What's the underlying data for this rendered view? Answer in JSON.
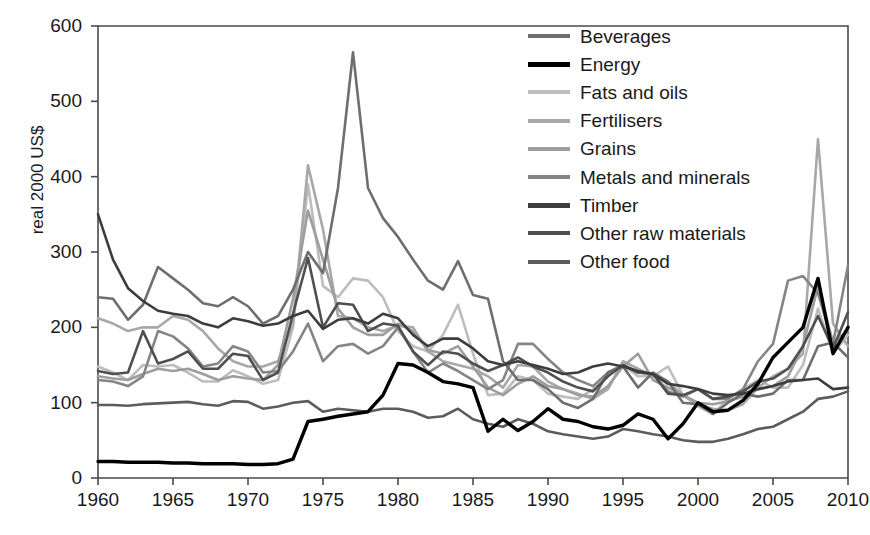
{
  "chart_data": {
    "type": "line",
    "title": "",
    "xlabel": "",
    "ylabel": "real 2000 US$",
    "xlim": [
      1960,
      2010
    ],
    "ylim": [
      0,
      600
    ],
    "grid": false,
    "legend_position": "inside-top-right",
    "x_ticks": [
      "1960",
      "1965",
      "1970",
      "1975",
      "1980",
      "1985",
      "1990",
      "1995",
      "2000",
      "2005",
      "2010"
    ],
    "y_ticks": [
      "0",
      "100",
      "200",
      "300",
      "400",
      "500",
      "600"
    ],
    "x": [
      1960,
      1961,
      1962,
      1963,
      1964,
      1965,
      1966,
      1967,
      1968,
      1969,
      1970,
      1971,
      1972,
      1973,
      1974,
      1975,
      1976,
      1977,
      1978,
      1979,
      1980,
      1981,
      1982,
      1983,
      1984,
      1985,
      1986,
      1987,
      1988,
      1989,
      1990,
      1991,
      1992,
      1993,
      1994,
      1995,
      1996,
      1997,
      1998,
      1999,
      2000,
      2001,
      2002,
      2003,
      2004,
      2005,
      2006,
      2007,
      2008,
      2009,
      2010
    ],
    "series": [
      {
        "name": "Beverages",
        "color": "#6e6e6e",
        "values": [
          240,
          238,
          210,
          230,
          280,
          265,
          250,
          232,
          228,
          240,
          228,
          205,
          215,
          250,
          300,
          272,
          385,
          565,
          385,
          345,
          320,
          290,
          262,
          250,
          288,
          243,
          238,
          155,
          130,
          130,
          118,
          100,
          93,
          105,
          140,
          148,
          120,
          140,
          128,
          100,
          98,
          85,
          100,
          112,
          108,
          112,
          130,
          130,
          175,
          180,
          160
        ]
      },
      {
        "name": "Energy",
        "color": "#000000",
        "values": [
          22,
          22,
          21,
          21,
          21,
          20,
          20,
          19,
          19,
          19,
          18,
          18,
          19,
          25,
          75,
          78,
          82,
          85,
          88,
          110,
          152,
          150,
          140,
          128,
          125,
          120,
          62,
          78,
          63,
          75,
          92,
          78,
          75,
          68,
          65,
          70,
          85,
          78,
          52,
          72,
          100,
          88,
          90,
          103,
          125,
          160,
          180,
          200,
          265,
          165,
          200
        ]
      },
      {
        "name": "Fats and oils",
        "color": "#bdbdbd",
        "values": [
          148,
          140,
          130,
          150,
          148,
          150,
          140,
          128,
          128,
          143,
          135,
          125,
          130,
          200,
          390,
          255,
          240,
          265,
          262,
          240,
          195,
          175,
          168,
          190,
          230,
          165,
          110,
          112,
          135,
          130,
          112,
          108,
          105,
          118,
          140,
          150,
          135,
          135,
          148,
          110,
          95,
          85,
          105,
          118,
          130,
          120,
          120,
          150,
          225,
          165,
          190
        ]
      },
      {
        "name": "Fertilisers",
        "color": "#a8a8a8",
        "values": [
          212,
          205,
          195,
          200,
          200,
          215,
          210,
          195,
          172,
          155,
          148,
          148,
          155,
          205,
          415,
          330,
          215,
          212,
          200,
          195,
          202,
          200,
          168,
          155,
          150,
          145,
          135,
          120,
          150,
          148,
          128,
          118,
          112,
          105,
          118,
          155,
          145,
          135,
          128,
          110,
          98,
          92,
          90,
          98,
          120,
          135,
          145,
          165,
          450,
          205,
          175
        ]
      },
      {
        "name": "Grains",
        "color": "#9e9e9e",
        "values": [
          135,
          132,
          130,
          138,
          145,
          142,
          145,
          138,
          130,
          135,
          132,
          130,
          150,
          238,
          355,
          290,
          225,
          200,
          190,
          190,
          205,
          195,
          170,
          165,
          175,
          148,
          120,
          110,
          125,
          135,
          122,
          118,
          110,
          108,
          122,
          148,
          165,
          130,
          120,
          110,
          100,
          98,
          102,
          108,
          118,
          122,
          135,
          175,
          255,
          180,
          195
        ]
      },
      {
        "name": "Metals and minerals",
        "color": "#858585",
        "values": [
          130,
          128,
          122,
          135,
          195,
          188,
          172,
          148,
          152,
          175,
          168,
          140,
          142,
          168,
          205,
          155,
          175,
          178,
          165,
          175,
          200,
          168,
          140,
          152,
          142,
          130,
          118,
          130,
          178,
          178,
          158,
          140,
          130,
          122,
          140,
          150,
          140,
          138,
          115,
          108,
          118,
          105,
          105,
          118,
          155,
          178,
          262,
          268,
          245,
          178,
          282
        ]
      },
      {
        "name": "Timber",
        "color": "#3d3d3d",
        "values": [
          350,
          290,
          252,
          235,
          222,
          218,
          215,
          205,
          200,
          212,
          208,
          202,
          205,
          215,
          222,
          198,
          210,
          212,
          205,
          218,
          212,
          190,
          175,
          185,
          185,
          172,
          155,
          150,
          155,
          150,
          145,
          138,
          140,
          148,
          152,
          148,
          142,
          138,
          125,
          122,
          118,
          112,
          110,
          112,
          118,
          122,
          128,
          130,
          132,
          118,
          120
        ]
      },
      {
        "name": "Other raw materials",
        "color": "#4f4f4f",
        "values": [
          142,
          138,
          140,
          195,
          152,
          158,
          168,
          145,
          145,
          165,
          162,
          130,
          140,
          218,
          292,
          200,
          232,
          230,
          195,
          205,
          202,
          168,
          150,
          168,
          165,
          152,
          142,
          150,
          160,
          148,
          140,
          128,
          120,
          115,
          135,
          150,
          140,
          138,
          112,
          110,
          118,
          105,
          108,
          115,
          128,
          132,
          145,
          175,
          215,
          172,
          220
        ]
      },
      {
        "name": "Other food",
        "color": "#5c5c5c",
        "values": [
          97,
          97,
          96,
          98,
          99,
          100,
          101,
          98,
          96,
          102,
          101,
          92,
          95,
          100,
          102,
          88,
          92,
          90,
          88,
          92,
          92,
          88,
          80,
          82,
          92,
          78,
          72,
          68,
          78,
          72,
          62,
          58,
          55,
          52,
          55,
          65,
          62,
          58,
          55,
          50,
          48,
          48,
          52,
          58,
          65,
          68,
          78,
          88,
          105,
          108,
          115
        ]
      }
    ]
  }
}
